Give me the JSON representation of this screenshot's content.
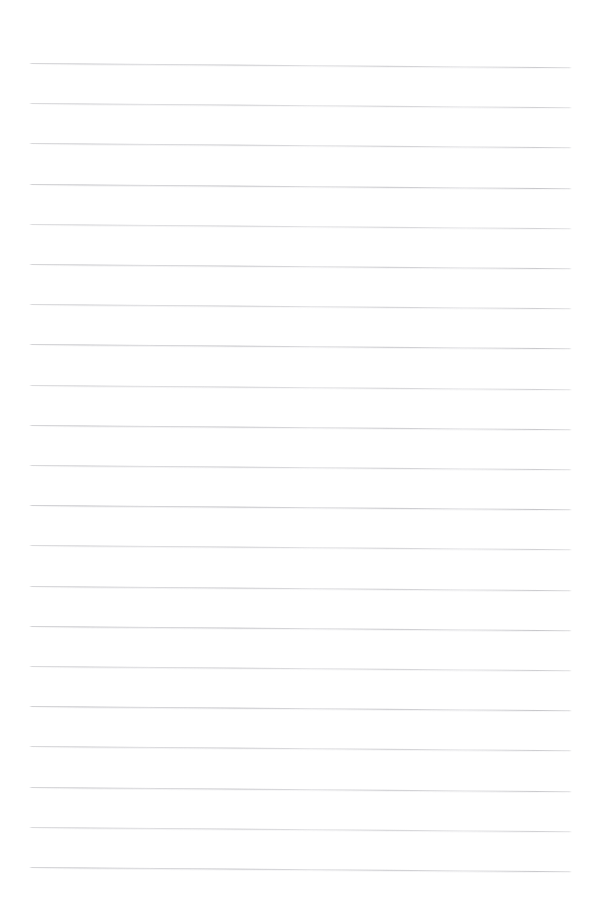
{
  "page": {
    "kind": "lined-paper",
    "width": 596,
    "height": 906,
    "background_color": "#ffffff",
    "content_text": "",
    "has_text": false,
    "has_margin_rule": false,
    "has_header": false,
    "has_footer": false,
    "has_page_number": false
  },
  "ruling": {
    "line_count": 21,
    "line_color": "#c8c8ce",
    "line_thickness_px": 1,
    "line_spacing_px": 40.2,
    "first_line_y": 63,
    "last_line_y": 868,
    "line_left_x": 29,
    "line_right_x": 572,
    "line_length_px": 543,
    "left_margin_px": 29,
    "right_margin_px": 24,
    "top_margin_px": 63,
    "bottom_margin_px": 38,
    "scan_tilt_deg": 0.45,
    "lines": [
      {
        "index": 1,
        "y": 63,
        "opacity": 0.72,
        "text": ""
      },
      {
        "index": 2,
        "y": 103.2,
        "opacity": 0.66,
        "text": ""
      },
      {
        "index": 3,
        "y": 143.4,
        "opacity": 0.7,
        "text": ""
      },
      {
        "index": 4,
        "y": 183.6,
        "opacity": 0.8,
        "text": ""
      },
      {
        "index": 5,
        "y": 223.8,
        "opacity": 0.62,
        "text": ""
      },
      {
        "index": 6,
        "y": 264.0,
        "opacity": 0.74,
        "text": ""
      },
      {
        "index": 7,
        "y": 304.2,
        "opacity": 0.68,
        "text": ""
      },
      {
        "index": 8,
        "y": 344.4,
        "opacity": 0.78,
        "text": ""
      },
      {
        "index": 9,
        "y": 384.6,
        "opacity": 0.64,
        "text": ""
      },
      {
        "index": 10,
        "y": 424.8,
        "opacity": 0.76,
        "text": ""
      },
      {
        "index": 11,
        "y": 465.0,
        "opacity": 0.7,
        "text": ""
      },
      {
        "index": 12,
        "y": 505.2,
        "opacity": 0.82,
        "text": ""
      },
      {
        "index": 13,
        "y": 545.4,
        "opacity": 0.66,
        "text": ""
      },
      {
        "index": 14,
        "y": 585.6,
        "opacity": 0.72,
        "text": ""
      },
      {
        "index": 15,
        "y": 625.8,
        "opacity": 0.78,
        "text": ""
      },
      {
        "index": 16,
        "y": 666.0,
        "opacity": 0.68,
        "text": ""
      },
      {
        "index": 17,
        "y": 706.2,
        "opacity": 0.8,
        "text": ""
      },
      {
        "index": 18,
        "y": 746.4,
        "opacity": 0.7,
        "text": ""
      },
      {
        "index": 19,
        "y": 786.6,
        "opacity": 0.74,
        "text": ""
      },
      {
        "index": 20,
        "y": 826.8,
        "opacity": 0.66,
        "text": ""
      },
      {
        "index": 21,
        "y": 867.0,
        "opacity": 0.76,
        "text": ""
      }
    ]
  }
}
